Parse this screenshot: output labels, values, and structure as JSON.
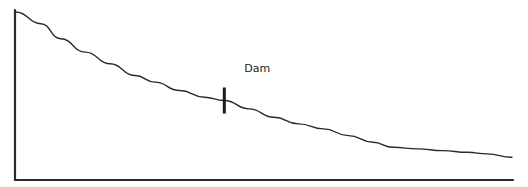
{
  "diagram": {
    "annotation": "Dam",
    "marker_position": 0.42,
    "colors": {
      "line": "#2a2a2a",
      "background": "#ffffff"
    }
  },
  "chart_data": {
    "type": "line",
    "title": "",
    "xlabel": "",
    "ylabel": "",
    "grid": false,
    "x": [
      0,
      0.05,
      0.09,
      0.14,
      0.19,
      0.24,
      0.28,
      0.33,
      0.38,
      0.42,
      0.47,
      0.52,
      0.57,
      0.62,
      0.67,
      0.72,
      0.76,
      0.81,
      0.86,
      0.91,
      0.95,
      1.0
    ],
    "series": [
      {
        "name": "profile",
        "values": [
          1.0,
          0.93,
          0.84,
          0.76,
          0.69,
          0.62,
          0.58,
          0.53,
          0.49,
          0.47,
          0.42,
          0.37,
          0.33,
          0.3,
          0.26,
          0.22,
          0.19,
          0.18,
          0.17,
          0.16,
          0.15,
          0.13
        ]
      }
    ],
    "annotations": [
      {
        "text": "Dam",
        "x": 0.42,
        "type": "vertical-tick"
      }
    ],
    "xlim": [
      0,
      1
    ],
    "ylim": [
      0,
      1.1
    ]
  }
}
